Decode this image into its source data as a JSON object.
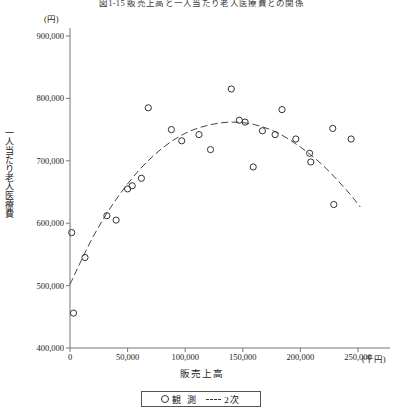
{
  "figure": {
    "title": "図1-15 販売上高と一人当たり老人医療費との関係",
    "y_unit": "(円)",
    "x_unit": "(千円)"
  },
  "legend": {
    "items": [
      {
        "marker": "circle",
        "label": "観 測"
      },
      {
        "marker": "dashed-line",
        "label": "2次"
      }
    ]
  },
  "chart_data": {
    "type": "scatter",
    "title": "図1-15 販売上高と一人当たり老人医療費との関係",
    "xlabel": "販売上高",
    "ylabel": "一人当たり老人医療費",
    "x_unit": "(千円)",
    "y_unit": "(円)",
    "xlim": [
      0,
      260000
    ],
    "ylim": [
      400000,
      900000
    ],
    "xticks": [
      0,
      50000,
      100000,
      150000,
      200000,
      250000
    ],
    "xtick_labels": [
      "0",
      "50,000",
      "100,000",
      "150,000",
      "200,000",
      "250,000"
    ],
    "yticks": [
      400000,
      500000,
      600000,
      700000,
      800000,
      900000
    ],
    "ytick_labels": [
      "400,000",
      "500,000",
      "600,000",
      "700,000",
      "800,000",
      "900,000"
    ],
    "grid": false,
    "legend_position": "bottom-center",
    "series": [
      {
        "name": "観 測",
        "type": "scatter",
        "marker": "open-circle",
        "points": [
          [
            1500,
            585000
          ],
          [
            3000,
            456000
          ],
          [
            13000,
            545000
          ],
          [
            32000,
            612000
          ],
          [
            40000,
            605000
          ],
          [
            50000,
            655000
          ],
          [
            54000,
            660000
          ],
          [
            62000,
            672000
          ],
          [
            68000,
            785000
          ],
          [
            88000,
            750000
          ],
          [
            97000,
            732000
          ],
          [
            112000,
            742000
          ],
          [
            122000,
            718000
          ],
          [
            140000,
            815000
          ],
          [
            147000,
            765000
          ],
          [
            152000,
            762000
          ],
          [
            159000,
            690000
          ],
          [
            167000,
            748000
          ],
          [
            178000,
            742000
          ],
          [
            184000,
            782000
          ],
          [
            196000,
            735000
          ],
          [
            208000,
            712000
          ],
          [
            209000,
            698000
          ],
          [
            228000,
            752000
          ],
          [
            229000,
            630000
          ],
          [
            244000,
            735000
          ]
        ]
      },
      {
        "name": "2次",
        "type": "line",
        "style": "dashed",
        "description": "quadratic fit curve",
        "points": [
          [
            0,
            502000
          ],
          [
            20000,
            578000
          ],
          [
            40000,
            638000
          ],
          [
            60000,
            685000
          ],
          [
            80000,
            720000
          ],
          [
            100000,
            744000
          ],
          [
            120000,
            757000
          ],
          [
            140000,
            762000
          ],
          [
            160000,
            758000
          ],
          [
            180000,
            745000
          ],
          [
            200000,
            722000
          ],
          [
            220000,
            692000
          ],
          [
            240000,
            653000
          ],
          [
            252000,
            626000
          ]
        ]
      }
    ]
  }
}
